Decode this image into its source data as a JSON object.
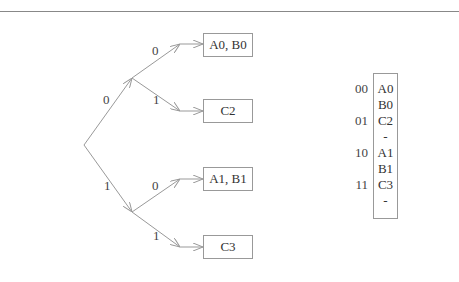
{
  "tree": {
    "edges": {
      "root_0": "0",
      "root_1": "1",
      "n0_0": "0",
      "n0_1": "1",
      "n1_0": "0",
      "n1_1": "1"
    },
    "leaves": [
      "A0, B0",
      "C2",
      "A1, B1",
      "C3"
    ]
  },
  "table": {
    "codes": [
      "00",
      "01",
      "10",
      "11"
    ],
    "entries": [
      "A0",
      "B0",
      "C2",
      "-",
      "A1",
      "B1",
      "C3",
      "-"
    ]
  },
  "colors": {
    "line": "#999999",
    "text": "#333333"
  }
}
